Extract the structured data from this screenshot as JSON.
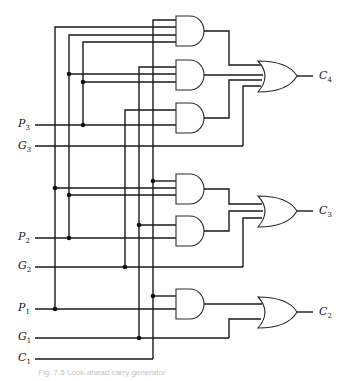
{
  "diagram": {
    "type": "logic-circuit",
    "inputs": [
      {
        "name": "P",
        "sub": "3",
        "y": 125
      },
      {
        "name": "G",
        "sub": "3",
        "y": 146
      },
      {
        "name": "P",
        "sub": "2",
        "y": 238
      },
      {
        "name": "G",
        "sub": "2",
        "y": 267
      },
      {
        "name": "P",
        "sub": "1",
        "y": 309
      },
      {
        "name": "G",
        "sub": "1",
        "y": 338
      },
      {
        "name": "C",
        "sub": "1",
        "y": 359
      }
    ],
    "outputs": [
      {
        "name": "C",
        "sub": "4",
        "y": 77
      },
      {
        "name": "C",
        "sub": "3",
        "y": 212
      },
      {
        "name": "C",
        "sub": "2",
        "y": 312
      }
    ],
    "gates": {
      "and_count": 6,
      "or_count": 3
    },
    "caption": "Fig. 7.5   Look-ahead carry generator"
  }
}
